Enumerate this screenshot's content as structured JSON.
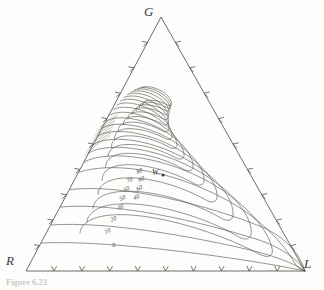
{
  "figure": {
    "type": "ternary-contour-diagram",
    "background_color": "#fdfdfb",
    "line_color": "#4a4a46",
    "caption": "Figure 6.23"
  },
  "vertices": {
    "top": "G",
    "bottom_left": "R",
    "bottom_right": "L"
  },
  "peak": {
    "marker_label": "W.",
    "description": "maximum point of the contoured surface"
  },
  "axes": {
    "ticks_per_edge": 9,
    "tick_interval": 10,
    "edges": [
      "left",
      "right",
      "bottom"
    ]
  },
  "contour_labels": [
    {
      "value": "80",
      "x": 136,
      "y": 167
    },
    {
      "value": "70",
      "x": 126,
      "y": 176
    },
    {
      "value": "60",
      "x": 138,
      "y": 175
    },
    {
      "value": "50",
      "x": 123,
      "y": 185
    },
    {
      "value": "60",
      "x": 136,
      "y": 184
    },
    {
      "value": "50",
      "x": 119,
      "y": 194
    },
    {
      "value": "40",
      "x": 133,
      "y": 193
    },
    {
      "value": "30",
      "x": 117,
      "y": 203
    },
    {
      "value": "20",
      "x": 110,
      "y": 215
    },
    {
      "value": "10",
      "x": 104,
      "y": 227
    },
    {
      "value": "0",
      "x": 112,
      "y": 241
    }
  ],
  "chart_data": {
    "type": "contour",
    "title": "",
    "xlabel": "",
    "ylabel": "",
    "coordinate_system": "ternary",
    "components": [
      "G",
      "R",
      "L"
    ],
    "levels": [
      0,
      10,
      20,
      30,
      40,
      50,
      60,
      70,
      80,
      90
    ],
    "level_count": 10,
    "maximum_marker": "W.",
    "axis_range": [
      0,
      100
    ],
    "grid": false,
    "legend": "none",
    "annotations": [
      "W."
    ]
  }
}
